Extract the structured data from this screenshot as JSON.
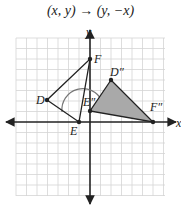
{
  "title": "(x, y) → (y, −x)",
  "axes": {
    "x_label": "x",
    "y_label": "y"
  },
  "grid": {
    "origin_px": [
      90,
      122
    ],
    "unit_px": 10.5
  },
  "figures": {
    "original": {
      "name": "DEF",
      "points": [
        {
          "label": "D",
          "coord": [
            -4,
            2
          ]
        },
        {
          "label": "E",
          "coord": [
            -1,
            0
          ]
        },
        {
          "label": "F",
          "coord": [
            0,
            6
          ]
        }
      ]
    },
    "image": {
      "name": "D″E″F″",
      "points": [
        {
          "label": "D″",
          "coord": [
            2,
            4
          ]
        },
        {
          "label": "E″",
          "coord": [
            0,
            1
          ]
        },
        {
          "label": "F″",
          "coord": [
            6,
            0
          ]
        }
      ],
      "fill": "#aaaaaa"
    }
  },
  "colors": {
    "grid": "#d0d0d0",
    "axis": "#222222",
    "shape_stroke": "#222222",
    "image_fill": "#a9a9a9"
  }
}
